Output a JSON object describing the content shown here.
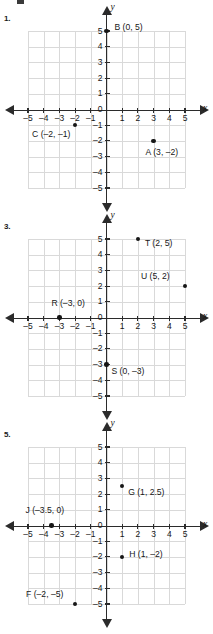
{
  "page": {
    "background": "#ffffff",
    "axis_color": "#2b2b2b",
    "grid_color": "#d9d9d9",
    "point_color": "#161616",
    "text_color": "#171717"
  },
  "problems": [
    {
      "number": "1.",
      "x_axis_label": "x",
      "y_axis_label": "y",
      "x_ticks": [
        "–5",
        "–4",
        "–3",
        "–2",
        "–1",
        "1",
        "2",
        "3",
        "4",
        "5"
      ],
      "y_ticks": [
        "5",
        "4",
        "3",
        "2",
        "1",
        "0",
        "–1",
        "–2",
        "–3",
        "–4",
        "–5"
      ],
      "origin_label": "0",
      "points": [
        {
          "name": "B",
          "coords": "(0, 5)",
          "label": "B (0, 5)",
          "x": 0,
          "y": 5,
          "label_dx": 8,
          "label_dy": -4
        },
        {
          "name": "C",
          "coords": "(–2, –1)",
          "label": "C (–2, –1)",
          "x": -2,
          "y": -1,
          "label_dx": -43,
          "label_dy": 9
        },
        {
          "name": "A",
          "coords": "(3, –2)",
          "label": "A (3, –2)",
          "x": 3,
          "y": -2,
          "label_dx": -8,
          "label_dy": 11
        }
      ]
    },
    {
      "number": "3.",
      "x_axis_label": "x",
      "y_axis_label": "y",
      "x_ticks": [
        "–5",
        "–4",
        "–3",
        "–2",
        "–1",
        "1",
        "2",
        "3",
        "4",
        "5"
      ],
      "y_ticks": [
        "5",
        "4",
        "3",
        "2",
        "1",
        "0",
        "–1",
        "–2",
        "–3",
        "–4",
        "–5"
      ],
      "origin_label": "0",
      "points": [
        {
          "name": "T",
          "coords": "(2, 5)",
          "label": "T (2, 5)",
          "x": 2,
          "y": 5,
          "label_dx": 7,
          "label_dy": 4
        },
        {
          "name": "U",
          "coords": "(5, 2)",
          "label": "U (5, 2)",
          "x": 5,
          "y": 2,
          "label_dx": -44,
          "label_dy": -10
        },
        {
          "name": "R",
          "coords": "(–3, 0)",
          "label": "R (–3, 0)",
          "x": -3,
          "y": 0,
          "label_dx": -8,
          "label_dy": -15
        },
        {
          "name": "S",
          "coords": "(0, –3)",
          "label": "S (0, –3)",
          "x": 0,
          "y": -3,
          "label_dx": 5,
          "label_dy": 6
        }
      ]
    },
    {
      "number": "5.",
      "x_axis_label": "x",
      "y_axis_label": "y",
      "x_ticks": [
        "–5",
        "–4",
        "–3",
        "–2",
        "–1",
        "1",
        "2",
        "3",
        "4",
        "5"
      ],
      "y_ticks": [
        "5",
        "4",
        "3",
        "2",
        "1",
        "0",
        "–1",
        "–2",
        "–3",
        "–4",
        "–5"
      ],
      "origin_label": "0",
      "points": [
        {
          "name": "G",
          "coords": "(1, 2.5)",
          "label": "G (1, 2.5)",
          "x": 1,
          "y": 2.5,
          "label_dx": 6,
          "label_dy": 6
        },
        {
          "name": "J",
          "coords": "(–3.5, 0)",
          "label": "J (–3.5, 0)",
          "x": -3.5,
          "y": 0,
          "label_dx": -26,
          "label_dy": -16
        },
        {
          "name": "H",
          "coords": "(1, –2)",
          "label": "H (1, –2)",
          "x": 1,
          "y": -2,
          "label_dx": 7,
          "label_dy": -3
        },
        {
          "name": "F",
          "coords": "(–2, –5)",
          "label": "F (–2, –5)",
          "x": -2,
          "y": -5,
          "label_dx": -49,
          "label_dy": -10
        }
      ]
    }
  ],
  "chart_data": [
    {
      "type": "scatter",
      "title": "1.",
      "xlabel": "x",
      "ylabel": "y",
      "xlim": [
        -5,
        5
      ],
      "ylim": [
        -5,
        5
      ],
      "grid": true,
      "points": [
        {
          "label": "B",
          "x": 0,
          "y": 5
        },
        {
          "label": "C",
          "x": -2,
          "y": -1
        },
        {
          "label": "A",
          "x": 3,
          "y": -2
        }
      ]
    },
    {
      "type": "scatter",
      "title": "3.",
      "xlabel": "x",
      "ylabel": "y",
      "xlim": [
        -5,
        5
      ],
      "ylim": [
        -5,
        5
      ],
      "grid": true,
      "points": [
        {
          "label": "T",
          "x": 2,
          "y": 5
        },
        {
          "label": "U",
          "x": 5,
          "y": 2
        },
        {
          "label": "R",
          "x": -3,
          "y": 0
        },
        {
          "label": "S",
          "x": 0,
          "y": -3
        }
      ]
    },
    {
      "type": "scatter",
      "title": "5.",
      "xlabel": "x",
      "ylabel": "y",
      "xlim": [
        -5,
        5
      ],
      "ylim": [
        -5,
        5
      ],
      "grid": true,
      "points": [
        {
          "label": "G",
          "x": 1,
          "y": 2.5
        },
        {
          "label": "J",
          "x": -3.5,
          "y": 0
        },
        {
          "label": "H",
          "x": 1,
          "y": -2
        },
        {
          "label": "F",
          "x": -2,
          "y": -5
        }
      ]
    }
  ]
}
